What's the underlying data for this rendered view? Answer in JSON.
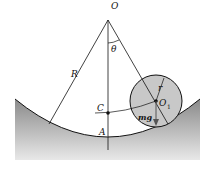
{
  "diagram": {
    "labels": {
      "O": "O",
      "theta": "θ",
      "R": "R",
      "r": "r",
      "O1": "O",
      "O1_sub": "1",
      "C": "C",
      "A": "A",
      "mg": "mg"
    },
    "colors": {
      "bowl_fill": "#9a9a9a",
      "disk_fill": "#c8c8c8",
      "line": "#111111"
    }
  }
}
